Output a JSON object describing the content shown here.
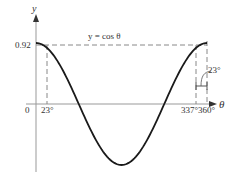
{
  "chart_data": {
    "type": "line",
    "title": "y = cos θ",
    "xlabel": "θ",
    "ylabel": "y",
    "x_unit": "degrees",
    "xlim": [
      0,
      360
    ],
    "ylim": [
      -1,
      1
    ],
    "grid": false,
    "series": [
      {
        "name": "y = cos θ",
        "x": [
          0,
          23,
          45,
          90,
          135,
          180,
          225,
          270,
          315,
          337,
          360
        ],
        "values": [
          1,
          0.92,
          0.71,
          0,
          -0.71,
          -1,
          -0.71,
          0,
          0.71,
          0.92,
          1
        ]
      }
    ],
    "reference_lines": [
      {
        "type": "horizontal",
        "y": 0.92,
        "style": "dashed",
        "label": "0.92"
      },
      {
        "type": "vertical",
        "x": 23,
        "style": "dashed",
        "label": "23°"
      },
      {
        "type": "vertical",
        "x": 337,
        "style": "dashed",
        "label": "337°"
      },
      {
        "type": "vertical",
        "x": 360,
        "style": "dashed",
        "label": "360°"
      }
    ],
    "annotations": [
      {
        "text": "y = cos θ",
        "position": "top-center"
      },
      {
        "text": "23°",
        "position": "between 337° and 360°",
        "note": "bracket marking interval width"
      }
    ],
    "tick_labels": {
      "x": [
        "0",
        "23°",
        "337°",
        "360°"
      ],
      "y": [
        "0.92"
      ]
    }
  },
  "labels": {
    "y_axis": "y",
    "x_axis": "θ",
    "origin": "0",
    "y_value": "0.92",
    "equation": "y = cos θ",
    "tick_23": "23°",
    "tick_337": "337°",
    "tick_360": "360°",
    "interval_callout": "23°"
  },
  "colors": {
    "curve": "#1a1a1a",
    "axis": "#999999",
    "dashed": "#888888",
    "text": "#333333"
  }
}
